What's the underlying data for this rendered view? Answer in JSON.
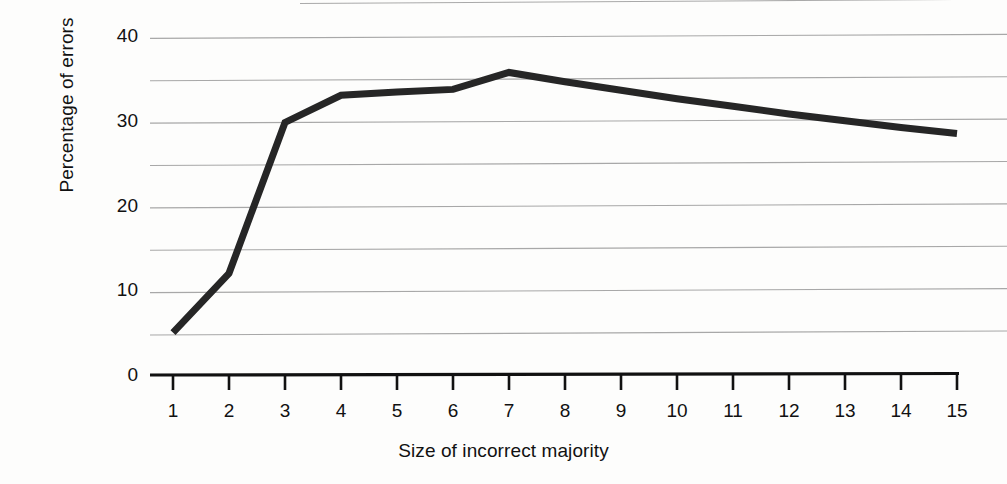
{
  "chart_data": {
    "type": "line",
    "title": "",
    "xlabel": "Size of incorrect majority",
    "ylabel": "Percentage of errors",
    "x": [
      1,
      2,
      3,
      4,
      5,
      6,
      7,
      8,
      9,
      10,
      11,
      12,
      13,
      14,
      15
    ],
    "values": [
      5,
      12,
      29.8,
      33,
      33.4,
      33.7,
      35.7,
      34.6,
      33.6,
      32.6,
      31.7,
      30.8,
      30.0,
      29.2,
      28.5
    ],
    "series": [
      {
        "name": "Percentage of errors",
        "values": [
          5,
          12,
          29.8,
          33,
          33.4,
          33.7,
          35.7,
          34.6,
          33.6,
          32.6,
          31.7,
          30.8,
          30.0,
          29.2,
          28.5
        ]
      }
    ],
    "xlim": [
      1,
      15
    ],
    "ylim": [
      0,
      40
    ],
    "xticks": [
      1,
      2,
      3,
      4,
      5,
      6,
      7,
      8,
      9,
      10,
      11,
      12,
      13,
      14,
      15
    ],
    "xtick_labels": [
      "1",
      "2",
      "3",
      "4",
      "5",
      "6",
      "7",
      "8",
      "9",
      "10",
      "11",
      "12",
      "13",
      "14",
      "15"
    ],
    "yticks": [
      0,
      10,
      20,
      30,
      40
    ],
    "ytick_labels": [
      "0",
      "10",
      "20",
      "30",
      "40"
    ],
    "y_minor_gridlines": [
      5,
      15,
      25,
      35
    ],
    "grid": "horizontal",
    "legend": "none",
    "line_color": "#262626",
    "gridline_color": "#9a9a9a",
    "axis_color": "#111111",
    "background_color": "#fdfdfc"
  },
  "axes": {
    "y_title": "Percentage of errors",
    "x_title": "Size of incorrect majority"
  }
}
